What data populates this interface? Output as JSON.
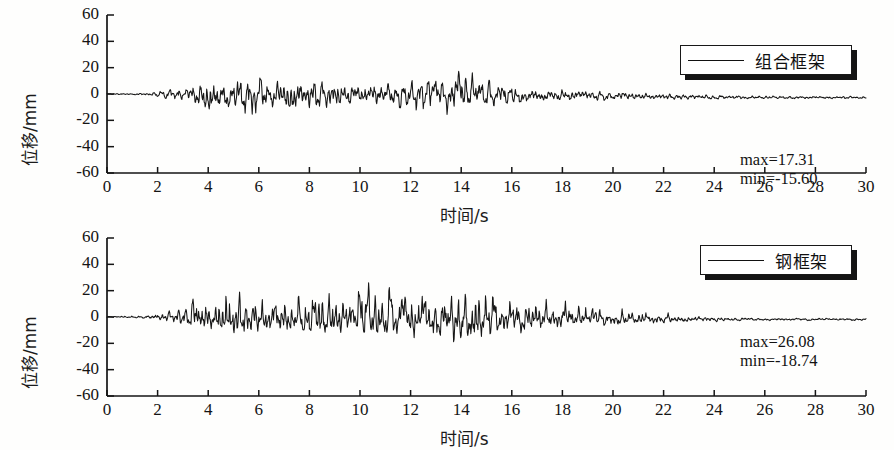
{
  "figure": {
    "background": "#fefefd",
    "line_color": "#151515"
  },
  "chart_data": [
    {
      "id": "top",
      "type": "line",
      "title": "",
      "xlabel": "时间/s",
      "ylabel": "位移/mm",
      "xlim": [
        0,
        30
      ],
      "ylim": [
        -60,
        60
      ],
      "xticks": [
        "0",
        "2",
        "4",
        "6",
        "8",
        "10",
        "12",
        "14",
        "16",
        "18",
        "20",
        "22",
        "24",
        "26",
        "28",
        "30"
      ],
      "yticks": [
        "60",
        "40",
        "20",
        "0",
        "-20",
        "-40",
        "-60"
      ],
      "grid": false,
      "legend_position": "top-right",
      "series": [
        {
          "name": "组合框架",
          "max": 17.31,
          "min": -15.6,
          "annotation_max": "max=17.31",
          "annotation_min": "min=-15.60"
        }
      ],
      "waveform": {
        "seed": 1337,
        "dt": 0.02,
        "envelope": [
          {
            "t": 0.0,
            "a": 0.3
          },
          {
            "t": 1.6,
            "a": 0.5
          },
          {
            "t": 2.4,
            "a": 2.6
          },
          {
            "t": 3.2,
            "a": 3.6
          },
          {
            "t": 4.1,
            "a": 10.5
          },
          {
            "t": 4.8,
            "a": 7.0
          },
          {
            "t": 5.4,
            "a": 11.0
          },
          {
            "t": 5.8,
            "a": 12.5
          },
          {
            "t": 6.4,
            "a": 7.0
          },
          {
            "t": 7.2,
            "a": 9.5
          },
          {
            "t": 7.8,
            "a": 8.5
          },
          {
            "t": 8.6,
            "a": 8.0
          },
          {
            "t": 9.4,
            "a": 6.0
          },
          {
            "t": 10.4,
            "a": 6.5
          },
          {
            "t": 11.2,
            "a": 6.0
          },
          {
            "t": 12.0,
            "a": 7.5
          },
          {
            "t": 12.6,
            "a": 9.5
          },
          {
            "t": 13.2,
            "a": 7.0
          },
          {
            "t": 13.9,
            "a": 11.5
          },
          {
            "t": 14.6,
            "a": 8.0
          },
          {
            "t": 15.4,
            "a": 6.0
          },
          {
            "t": 16.2,
            "a": 4.5
          },
          {
            "t": 17.4,
            "a": 3.6
          },
          {
            "t": 18.6,
            "a": 3.0
          },
          {
            "t": 20.0,
            "a": 2.4
          },
          {
            "t": 21.5,
            "a": 1.8
          },
          {
            "t": 23.0,
            "a": 1.3
          },
          {
            "t": 25.0,
            "a": 0.9
          },
          {
            "t": 27.0,
            "a": 0.7
          },
          {
            "t": 30.0,
            "a": 0.6
          }
        ],
        "baseline": [
          {
            "t": 0.0,
            "v": 0.0
          },
          {
            "t": 8.0,
            "v": -0.8
          },
          {
            "t": 14.0,
            "v": -0.6
          },
          {
            "t": 20.0,
            "v": -1.8
          },
          {
            "t": 24.0,
            "v": -2.6
          },
          {
            "t": 30.0,
            "v": -2.8
          }
        ]
      }
    },
    {
      "id": "bottom",
      "type": "line",
      "title": "",
      "xlabel": "时间/s",
      "ylabel": "位移/mm",
      "xlim": [
        0,
        30
      ],
      "ylim": [
        -60,
        60
      ],
      "xticks": [
        "0",
        "2",
        "4",
        "6",
        "8",
        "10",
        "12",
        "14",
        "16",
        "18",
        "20",
        "22",
        "24",
        "26",
        "28",
        "30"
      ],
      "yticks": [
        "60",
        "40",
        "20",
        "0",
        "-20",
        "-40",
        "-60"
      ],
      "grid": false,
      "legend_position": "top-right",
      "series": [
        {
          "name": "钢框架",
          "max": 26.08,
          "min": -18.74,
          "annotation_max": "max=26.08",
          "annotation_min": "min=-18.74"
        }
      ],
      "waveform": {
        "seed": 90210,
        "dt": 0.02,
        "envelope": [
          {
            "t": 0.0,
            "a": 0.3
          },
          {
            "t": 1.4,
            "a": 0.6
          },
          {
            "t": 2.2,
            "a": 2.4
          },
          {
            "t": 3.0,
            "a": 5.5
          },
          {
            "t": 3.5,
            "a": 10.5
          },
          {
            "t": 4.2,
            "a": 9.0
          },
          {
            "t": 4.7,
            "a": 17.5
          },
          {
            "t": 5.3,
            "a": 13.0
          },
          {
            "t": 5.6,
            "a": 14.0
          },
          {
            "t": 6.2,
            "a": 11.0
          },
          {
            "t": 6.9,
            "a": 12.5
          },
          {
            "t": 7.6,
            "a": 10.0
          },
          {
            "t": 8.4,
            "a": 15.5
          },
          {
            "t": 9.1,
            "a": 12.5
          },
          {
            "t": 9.8,
            "a": 11.5
          },
          {
            "t": 10.2,
            "a": 16.5
          },
          {
            "t": 10.9,
            "a": 12.0
          },
          {
            "t": 11.4,
            "a": 14.0
          },
          {
            "t": 12.1,
            "a": 16.5
          },
          {
            "t": 12.8,
            "a": 12.0
          },
          {
            "t": 13.5,
            "a": 14.5
          },
          {
            "t": 14.0,
            "a": 17.5
          },
          {
            "t": 14.6,
            "a": 18.5
          },
          {
            "t": 15.2,
            "a": 13.0
          },
          {
            "t": 16.0,
            "a": 11.0
          },
          {
            "t": 16.8,
            "a": 9.5
          },
          {
            "t": 17.6,
            "a": 8.5
          },
          {
            "t": 18.5,
            "a": 7.0
          },
          {
            "t": 19.5,
            "a": 5.5
          },
          {
            "t": 20.5,
            "a": 4.5
          },
          {
            "t": 21.5,
            "a": 3.5
          },
          {
            "t": 22.5,
            "a": 2.8
          },
          {
            "t": 23.5,
            "a": 2.0
          },
          {
            "t": 24.5,
            "a": 1.2
          },
          {
            "t": 26.0,
            "a": 0.9
          },
          {
            "t": 28.0,
            "a": 0.8
          },
          {
            "t": 30.0,
            "a": 0.7
          }
        ],
        "baseline": [
          {
            "t": 0.0,
            "v": 0.0
          },
          {
            "t": 6.0,
            "v": -1.0
          },
          {
            "t": 11.0,
            "v": -1.2
          },
          {
            "t": 16.0,
            "v": -1.6
          },
          {
            "t": 21.0,
            "v": -2.4
          },
          {
            "t": 25.0,
            "v": -3.0
          },
          {
            "t": 30.0,
            "v": -3.0
          }
        ]
      }
    }
  ]
}
